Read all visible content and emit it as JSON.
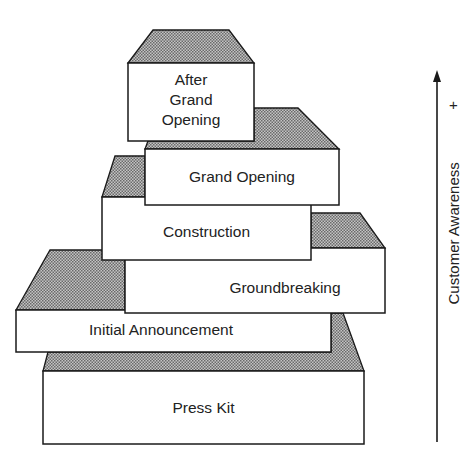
{
  "diagram": {
    "type": "stacked-blocks",
    "top_clipped_text": "",
    "blocks": [
      {
        "id": "after-grand-opening",
        "label_lines": [
          "After",
          "Grand",
          "Opening"
        ]
      },
      {
        "id": "grand-opening",
        "label": "Grand Opening"
      },
      {
        "id": "construction",
        "label": "Construction"
      },
      {
        "id": "groundbreaking",
        "label": "Groundbreaking"
      },
      {
        "id": "initial-announcement",
        "label": "Initial Announcement"
      },
      {
        "id": "press-kit",
        "label": "Press Kit"
      }
    ],
    "axis": {
      "label": "Customer Awareness",
      "direction": "up",
      "high_marker": "+"
    },
    "colors": {
      "stroke": "#1a1a1a",
      "shade": "#9a9a9a",
      "fill": "#ffffff"
    }
  }
}
